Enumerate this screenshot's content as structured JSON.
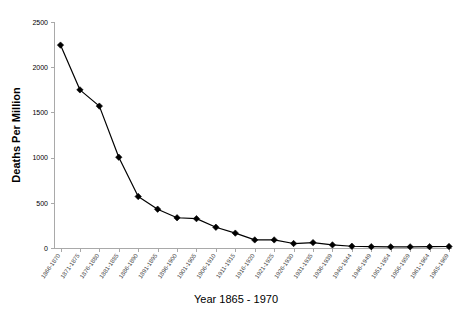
{
  "chart_data": {
    "type": "line",
    "title": "",
    "xlabel": "Year 1865 - 1970",
    "ylabel": "Deaths Per Million",
    "ylim": [
      0,
      2500
    ],
    "yticks": [
      0,
      500,
      1000,
      1500,
      2000,
      2500
    ],
    "ytick_labels": [
      "0",
      "500",
      "1000",
      "1500",
      "2000",
      "2500"
    ],
    "grid": false,
    "legend": "none",
    "marker": "diamond",
    "marker_color": "#000000",
    "line_color": "#000000",
    "categories": [
      "1866-1870",
      "1871-1875",
      "1876-1880",
      "1881-1885",
      "1886-1890",
      "1891-1895",
      "1896-1900",
      "1901-1905",
      "1906-1910",
      "1911-1915",
      "1916-1920",
      "1921-1925",
      "1926-1930",
      "1931-1935",
      "1936-1939",
      "1940-1944",
      "1946-1949",
      "1951-1954",
      "1956-1959",
      "1961-1964",
      "1965-1969"
    ],
    "values": [
      2250,
      1755,
      1575,
      1010,
      575,
      435,
      340,
      330,
      235,
      170,
      95,
      95,
      55,
      65,
      40,
      25,
      20,
      18,
      18,
      20,
      22
    ],
    "series": [
      {
        "name": "Deaths Per Million",
        "values": [
          2250,
          1755,
          1575,
          1010,
          575,
          435,
          340,
          330,
          235,
          170,
          95,
          95,
          55,
          65,
          40,
          25,
          20,
          18,
          18,
          20,
          22
        ]
      }
    ]
  },
  "axes": {
    "y_title": "Deaths Per Million",
    "x_title": "Year 1865 - 1970"
  }
}
